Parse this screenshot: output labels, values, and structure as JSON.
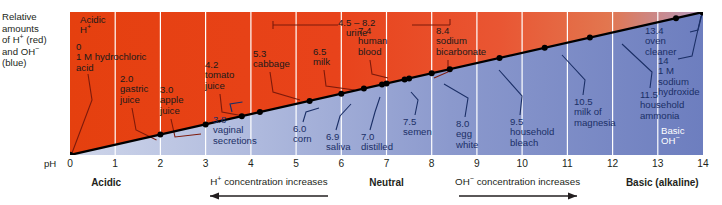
{
  "y_axis_caption": [
    "Relative",
    "amounts",
    "of H⁺ (red)",
    "and OH⁻",
    "(blue)"
  ],
  "axis": {
    "ph_tag": "pH",
    "ticks": [
      "0",
      "1",
      "2",
      "3",
      "4",
      "5",
      "6",
      "7",
      "8",
      "9",
      "10",
      "11",
      "12",
      "13",
      "14"
    ],
    "zones": [
      {
        "label": "Acidic",
        "ph": 0.8
      },
      {
        "label": "Neutral",
        "ph": 7.0
      },
      {
        "label": "Basic (alkaline)",
        "ph": 13.1
      }
    ],
    "flows": [
      {
        "label": "H⁺ concentration increases",
        "ph": 4.4,
        "direction": "left"
      },
      {
        "label": "OH⁻ concentration increases",
        "ph": 9.9,
        "direction": "right"
      }
    ]
  },
  "region_labels": {
    "acidic_top": [
      "Acidic",
      "H⁺"
    ],
    "basic_bottom": [
      "Basic",
      "OH⁻"
    ]
  },
  "colors": {
    "acid_red": "#e8411d",
    "acid_red_deep": "#e03c18",
    "base_blue": "#6e7fc0",
    "base_blue_light": "#c9d2e8",
    "grid_white": "#ffffff",
    "line_black": "#000000",
    "leader_red": "#8c1d0e",
    "leader_blue": "#1b2f66",
    "text_dark": "#231f20"
  },
  "chart_data": {
    "type": "scatter",
    "title": "",
    "xlabel": "pH",
    "ylabel": "Relative amounts of H+ (red) and OH- (blue)",
    "xlim": [
      0,
      14
    ],
    "grid": true,
    "legend": "none",
    "annotations": [
      {
        "ph": 4.5,
        "ph_high": 8.2,
        "value": "4.5 – 8.2",
        "substance": "urine",
        "range": true
      }
    ],
    "points": [
      {
        "ph": 0,
        "value": "0",
        "substance": "1 M hydrochloric acid",
        "side": "above"
      },
      {
        "ph": 2.0,
        "value": "2.0",
        "substance": "gastric juice",
        "side": "above"
      },
      {
        "ph": 3.0,
        "value": "3.0",
        "substance": "apple juice",
        "side": "above"
      },
      {
        "ph": 3.8,
        "value": "3.8",
        "substance": "vaginal secretions",
        "side": "below"
      },
      {
        "ph": 4.2,
        "value": "4.2",
        "substance": "tomato juice",
        "side": "above"
      },
      {
        "ph": 5.3,
        "value": "5.3",
        "substance": "cabbage",
        "side": "above"
      },
      {
        "ph": 6.0,
        "value": "6.0",
        "substance": "corn",
        "side": "below"
      },
      {
        "ph": 6.5,
        "value": "6.5",
        "substance": "milk",
        "side": "above"
      },
      {
        "ph": 6.9,
        "value": "6.9",
        "substance": "saliva",
        "side": "below"
      },
      {
        "ph": 7.0,
        "value": "7.0",
        "substance": "distilled water",
        "side": "below"
      },
      {
        "ph": 7.4,
        "value": "7.4",
        "substance": "human blood",
        "side": "above"
      },
      {
        "ph": 7.5,
        "value": "7.5",
        "substance": "semen",
        "side": "below"
      },
      {
        "ph": 8.0,
        "value": "8.0",
        "substance": "egg white",
        "side": "below"
      },
      {
        "ph": 8.4,
        "value": "8.4",
        "substance": "sodium bicarbonate",
        "side": "above"
      },
      {
        "ph": 9.5,
        "value": "9.5",
        "substance": "household bleach",
        "side": "below"
      },
      {
        "ph": 10.5,
        "value": "10.5",
        "substance": "milk of magnesia",
        "side": "below"
      },
      {
        "ph": 11.5,
        "value": "11.5",
        "substance": "household ammonia",
        "side": "below"
      },
      {
        "ph": 13.4,
        "value": "13.4",
        "substance": "oven cleaner",
        "side": "above"
      },
      {
        "ph": 14,
        "value": "14",
        "substance": "1 M sodium hydroxide",
        "side": "below"
      }
    ]
  },
  "labels": [
    {
      "name": "hydrochloric-acid",
      "lines": [
        "0",
        "1 M hydrochloric",
        "acid"
      ],
      "x": 6,
      "y": 30,
      "cls": "red"
    },
    {
      "name": "gastric-juice",
      "lines": [
        "2.0",
        "gastric",
        "juice"
      ],
      "x": 50,
      "y": 62,
      "cls": "red"
    },
    {
      "name": "apple-juice",
      "lines": [
        "3.0",
        "apple",
        "juice"
      ],
      "x": 90,
      "y": 73,
      "cls": "red"
    },
    {
      "name": "tomato-juice",
      "lines": [
        "4.2",
        "tomato",
        "juice"
      ],
      "x": 135,
      "y": 48,
      "cls": "red"
    },
    {
      "name": "vaginal-secretions",
      "lines": [
        "3.8",
        "vaginal",
        "secretions",
        " "
      ],
      "x": 143,
      "y": 103,
      "cls": "blue"
    },
    {
      "name": "cabbage",
      "lines": [
        "5.3",
        "cabbage"
      ],
      "x": 183,
      "y": 37,
      "cls": "red"
    },
    {
      "name": "corn",
      "lines": [
        "6.0",
        "corn"
      ],
      "x": 223,
      "y": 112,
      "cls": "blue"
    },
    {
      "name": "milk",
      "lines": [
        "6.5",
        "milk"
      ],
      "x": 243,
      "y": 35,
      "cls": "red"
    },
    {
      "name": "saliva",
      "lines": [
        "6.9",
        "saliva"
      ],
      "x": 256,
      "y": 120,
      "cls": "blue"
    },
    {
      "name": "distilled-water",
      "lines": [
        "7.0",
        "distilled",
        "water"
      ],
      "x": 291,
      "y": 120,
      "cls": "blue"
    },
    {
      "name": "human-blood",
      "lines": [
        "7.4",
        "human",
        "blood"
      ],
      "x": 288,
      "y": 14,
      "cls": "red"
    },
    {
      "name": "semen",
      "lines": [
        "7.5",
        "semen"
      ],
      "x": 333,
      "y": 105,
      "cls": "blue"
    },
    {
      "name": "egg-white",
      "lines": [
        "8.0",
        "egg",
        "white"
      ],
      "x": 386,
      "y": 107,
      "cls": "blue"
    },
    {
      "name": "sodium-bicarbonate",
      "lines": [
        "8.4",
        "sodium",
        "bicarbonate"
      ],
      "x": 366,
      "y": 14,
      "cls": "red"
    },
    {
      "name": "household-bleach",
      "lines": [
        "9.5",
        "household",
        "bleach"
      ],
      "x": 440,
      "y": 105,
      "cls": "blue"
    },
    {
      "name": "milk-of-magnesia",
      "lines": [
        "10.5",
        "milk of",
        "magnesia"
      ],
      "x": 504,
      "y": 85,
      "cls": "blue"
    },
    {
      "name": "household-ammonia",
      "lines": [
        "11.5",
        "household",
        "ammonia"
      ],
      "x": 570,
      "y": 78,
      "cls": "blue"
    },
    {
      "name": "oven-cleaner",
      "lines": [
        "13.4",
        "oven",
        "cleaner"
      ],
      "x": 575,
      "y": 14,
      "cls": "blue"
    },
    {
      "name": "sodium-hydroxide",
      "lines": [
        "14",
        "1 M",
        "sodium",
        "hydroxide"
      ],
      "x": 588,
      "y": 44,
      "cls": "blue"
    }
  ]
}
